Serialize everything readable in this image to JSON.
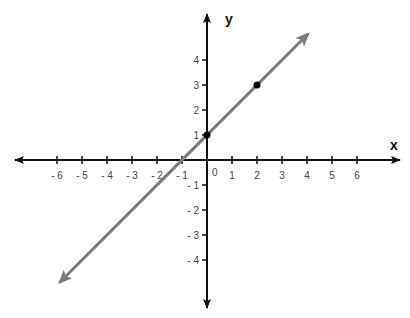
{
  "chart_data": {
    "type": "line",
    "title": "",
    "xlabel": "x",
    "ylabel": "y",
    "origin_label": "0",
    "x_ticks": [
      -6,
      -5,
      -4,
      -3,
      -2,
      -1,
      1,
      2,
      3,
      4,
      5,
      6
    ],
    "x_tick_labels": [
      "- 6",
      "- 5",
      "- 4",
      "- 3",
      "- 2",
      "- 1",
      "1",
      "2",
      "3",
      "4",
      "5",
      "6"
    ],
    "y_ticks": [
      4,
      3,
      2,
      1,
      -1,
      -2,
      -3,
      -4
    ],
    "y_tick_labels": [
      "4",
      "3",
      "2",
      "1",
      "- 1",
      "- 2",
      "- 3",
      "- 4"
    ],
    "xlim": [
      -7.7,
      7.7
    ],
    "ylim": [
      -5.9,
      5.8
    ],
    "grid": false,
    "series": [
      {
        "name": "y = x + 1",
        "equation": "y = x + 1",
        "color": "#7a7a7a",
        "x": [
          -5.9,
          4.05
        ],
        "y": [
          -4.9,
          5.05
        ],
        "arrows": "both"
      }
    ],
    "points": [
      {
        "x": 0,
        "y": 1,
        "color": "#000000"
      },
      {
        "x": 2,
        "y": 3,
        "color": "#000000"
      }
    ]
  }
}
